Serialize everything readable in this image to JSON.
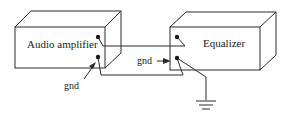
{
  "diagram": {
    "devices": [
      {
        "id": "amplifier",
        "label": "Audio amplifier"
      },
      {
        "id": "equalizer",
        "label": "Equalizer"
      }
    ],
    "labels": {
      "amp_gnd": "gnd",
      "eq_gnd": "gnd"
    },
    "colors": {
      "line": "#2a2a2a",
      "background": "#ffffff"
    }
  }
}
